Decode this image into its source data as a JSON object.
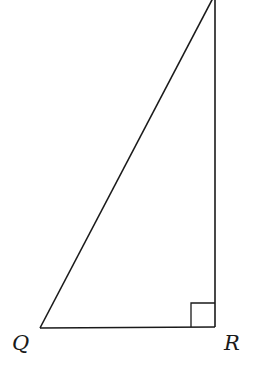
{
  "diagram": {
    "type": "right-triangle",
    "stroke_color": "#1a1a1a",
    "vertices": {
      "top": {
        "x": 213,
        "y": -2,
        "label": ""
      },
      "Q": {
        "x": 40,
        "y": 328,
        "label": "Q"
      },
      "R": {
        "x": 215,
        "y": 327,
        "label": "R"
      }
    },
    "right_angle_at": "R",
    "right_angle_marker_size": 24,
    "labels": {
      "Q": "Q",
      "R": "R"
    }
  }
}
